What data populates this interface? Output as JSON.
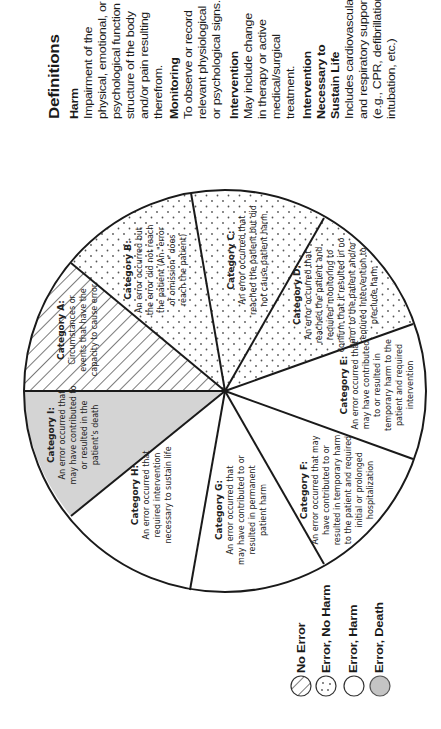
{
  "definitions": {
    "title": "Definitions",
    "items": [
      {
        "term": [
          "Harm"
        ],
        "lines": [
          "Impairment of the",
          "physical, emotional, or",
          "psychological function or",
          "structure of the body",
          "and/or pain resulting",
          "therefrom."
        ]
      },
      {
        "term": [
          "Monitoring"
        ],
        "lines": [
          "To observe or record",
          "relevant physiological",
          "or psychological signs."
        ]
      },
      {
        "term": [
          "Intervention"
        ],
        "lines": [
          "May include change",
          "in therapy or active",
          "medical/surgical",
          "treatment."
        ]
      },
      {
        "term": [
          "Intervention",
          "Necessary to",
          "Sustain Life"
        ],
        "lines": [
          "Includes cardiovascular",
          "and respiratory support",
          "(e.g., CPR, defibrillation,",
          "intubation, etc.)"
        ]
      }
    ]
  },
  "colors": {
    "outline": "#1a1a1a",
    "death_fill": "#d4d4d4",
    "harm_fill": "#ffffff",
    "no_harm_dots": "#555555",
    "no_error_hatch": "#333333"
  },
  "pie": {
    "center": [
      225,
      391
    ],
    "radius": 201,
    "categories": [
      {
        "id": "A",
        "title": "Category A:",
        "lines": [
          "Circumstances or",
          "events that have the",
          "capacity to cause error"
        ],
        "group": "no_error"
      },
      {
        "id": "B",
        "title": "Category B:",
        "lines": [
          "An error occurred but",
          "the error did not reach",
          "the patient (An \"error",
          "of omission\" does",
          "reach the patient)"
        ],
        "group": "error_no_harm"
      },
      {
        "id": "C",
        "title": "Category C:",
        "lines": [
          "An error occurred that",
          "reached the patient but did",
          "not cause patient harm"
        ],
        "group": "error_no_harm"
      },
      {
        "id": "D",
        "title": "Category D:",
        "lines": [
          "An error occurred that",
          "reached the patient and",
          "required monitoring to",
          "confirm that it resulted in no",
          "harm to the patient and/or",
          "required intervention to",
          "preclude harm"
        ],
        "group": "error_no_harm"
      },
      {
        "id": "E",
        "title": "Category E:",
        "lines": [
          "An error occurred that",
          "may have contributed",
          "to or resulted in",
          "temporary harm to the",
          "patient and required",
          "intervention"
        ],
        "group": "error_harm"
      },
      {
        "id": "F",
        "title": "Category F:",
        "lines": [
          "An error occurred that may",
          "have contributed to or",
          "resulted in temporary harm",
          "to the patient and required",
          "initial or prolonged",
          "hospitalization"
        ],
        "group": "error_harm"
      },
      {
        "id": "G",
        "title": "Category G:",
        "lines": [
          "An error occurred that",
          "may have contributed to or",
          "resulted in permanent",
          "patient harm"
        ],
        "group": "error_harm"
      },
      {
        "id": "H",
        "title": "Category H:",
        "lines": [
          "An error occurred that",
          "required intervention",
          "necessary to sustain life"
        ],
        "group": "error_harm"
      },
      {
        "id": "I",
        "title": "Category I:",
        "lines": [
          "An error occurred that",
          "may have contributed to",
          "or resulted in the",
          "patient's death"
        ],
        "group": "error_death"
      }
    ]
  },
  "legend": {
    "items": [
      {
        "label": "No Error",
        "group": "no_error"
      },
      {
        "label": "Error, No Harm",
        "group": "error_no_harm"
      },
      {
        "label": "Error, Harm",
        "group": "error_harm"
      },
      {
        "label": "Error, Death",
        "group": "error_death"
      }
    ]
  }
}
